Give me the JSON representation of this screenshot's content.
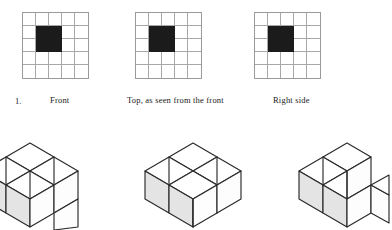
{
  "page": {
    "problem_number": "1.",
    "grid": {
      "rows": 5,
      "cols": 5
    }
  },
  "views": [
    {
      "id": "front",
      "label": "Front",
      "icon": "grid-5x5-icon",
      "filled_cells": [
        [
          2,
          2
        ],
        [
          2,
          3
        ],
        [
          3,
          2
        ],
        [
          3,
          3
        ]
      ]
    },
    {
      "id": "top",
      "label": "Top, as seen from the front",
      "icon": "grid-5x5-icon",
      "filled_cells": [
        [
          2,
          2
        ],
        [
          2,
          3
        ],
        [
          3,
          2
        ],
        [
          3,
          3
        ]
      ]
    },
    {
      "id": "right",
      "label": "Right side",
      "icon": "grid-5x5-icon",
      "filled_cells": [
        [
          2,
          2
        ],
        [
          2,
          3
        ],
        [
          3,
          2
        ],
        [
          3,
          3
        ]
      ]
    }
  ],
  "solids": [
    {
      "id": "solid-left",
      "name": "isometric-cube-assembly-left",
      "cube_count": 7
    },
    {
      "id": "solid-middle",
      "name": "isometric-cube-assembly-middle",
      "cube_count": 7
    },
    {
      "id": "solid-right",
      "name": "isometric-cube-assembly-right",
      "cube_count": 5
    }
  ],
  "colors": {
    "fill_dark": "#1b1b1b",
    "grid_line": "#a8a8a8",
    "edge": "#2a2a2a",
    "face_shaded": "#e4e4e4",
    "background": "#ffffff"
  }
}
